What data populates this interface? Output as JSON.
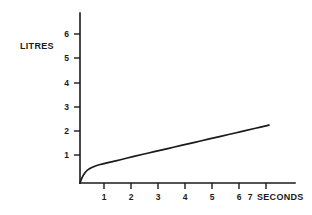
{
  "chart_data": {
    "type": "line",
    "title": "",
    "xlabel": "SECONDS",
    "ylabel": "LITRES",
    "xlim": [
      0,
      8
    ],
    "ylim": [
      0,
      6.9
    ],
    "grid": false,
    "legend": null,
    "x_ticks": [
      1,
      2,
      3,
      4,
      5,
      6,
      7
    ],
    "x_tick_labels": [
      "1",
      "2",
      "3",
      "4",
      "5",
      "6",
      "7"
    ],
    "y_ticks": [
      1,
      2,
      3,
      4,
      5,
      6
    ],
    "y_tick_labels": [
      "1",
      "2",
      "3",
      "4",
      "5",
      "6"
    ],
    "series": [
      {
        "name": "cumulative volume",
        "color": "#1a1a1a",
        "x": [
          0.0,
          0.06,
          0.12,
          0.2,
          0.3,
          0.42,
          0.55,
          0.75,
          1.0,
          1.5,
          2.0,
          2.5,
          3.0,
          3.5,
          4.0,
          4.5,
          5.0,
          5.5,
          6.0,
          6.5,
          7.0
        ],
        "y": [
          0.0,
          0.18,
          0.32,
          0.45,
          0.56,
          0.64,
          0.7,
          0.77,
          0.84,
          0.97,
          1.11,
          1.24,
          1.37,
          1.5,
          1.63,
          1.76,
          1.89,
          2.02,
          2.15,
          2.28,
          2.41
        ]
      }
    ],
    "annotations": []
  },
  "axes": {
    "y_label_text": "LITRES",
    "x_label_text": "SECONDS"
  }
}
